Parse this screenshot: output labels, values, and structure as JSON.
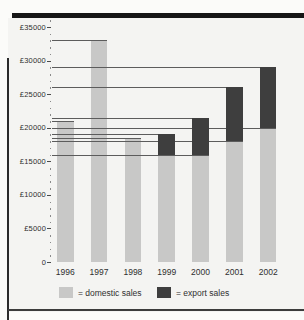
{
  "figure": {
    "kind": "scanned textbook bar chart",
    "page_background": "#fbfbf9",
    "chart_background": "#f4f4f2",
    "border_color": "#161616"
  },
  "chart_data": {
    "type": "bar",
    "stacked": true,
    "categories": [
      "1996",
      "1997",
      "1998",
      "1999",
      "2000",
      "2001",
      "2002"
    ],
    "series": [
      {
        "name": "domestic sales",
        "color": "#c8c8c7",
        "values": [
          21000,
          33000,
          18500,
          16000,
          16000,
          18000,
          20000
        ]
      },
      {
        "name": "export sales",
        "color": "#3e3e3e",
        "values": [
          0,
          0,
          0,
          3000,
          5500,
          8000,
          9000
        ]
      }
    ],
    "totals": [
      21000,
      33000,
      18500,
      19000,
      21500,
      26000,
      29000
    ],
    "title": "",
    "xlabel": "",
    "ylabel": "",
    "currency_prefix": "£",
    "ytick_labels": [
      "£35000",
      "£30000",
      "£25000",
      "£20000",
      "£15000",
      "£10000",
      "£5000",
      "0"
    ],
    "ytick_values": [
      35000,
      30000,
      25000,
      20000,
      15000,
      10000,
      5000,
      0
    ],
    "minor_tick_step": 1000,
    "ylim": [
      0,
      35000
    ],
    "grid": "horizontal reference lines drawn from y-axis to the top of each bar segment",
    "legend_position": "bottom",
    "legend": [
      {
        "label": "= domestic sales",
        "name": "domestic sales",
        "color": "#c8c8c7"
      },
      {
        "label": "= export sales",
        "name": "export sales",
        "color": "#3e3e3e"
      }
    ]
  }
}
